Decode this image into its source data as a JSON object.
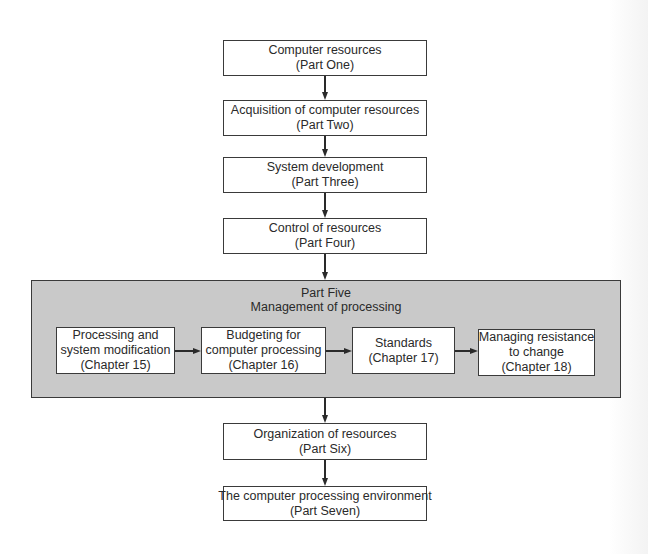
{
  "diagram": {
    "type": "flowchart",
    "nodes": [
      {
        "id": "p1",
        "line1": "Computer resources",
        "line2": "(Part One)"
      },
      {
        "id": "p2",
        "line1": "Acquisition of computer resources",
        "line2": "(Part Two)"
      },
      {
        "id": "p3",
        "line1": "System development",
        "line2": "(Part Three)"
      },
      {
        "id": "p4",
        "line1": "Control of resources",
        "line2": "(Part Four)"
      },
      {
        "id": "p6",
        "line1": "Organization of resources",
        "line2": "(Part Six)"
      },
      {
        "id": "p7",
        "line1": "The computer processing environment",
        "line2": "(Part Seven)"
      }
    ],
    "part_five": {
      "title_line1": "Part Five",
      "title_line2": "Management of processing",
      "fill_color": "#c9c9c9",
      "chapters": [
        {
          "id": "c15",
          "lines": [
            "Processing and",
            "system modification",
            "(Chapter 15)"
          ]
        },
        {
          "id": "c16",
          "lines": [
            "Budgeting for",
            "computer processing",
            "(Chapter 16)"
          ]
        },
        {
          "id": "c17",
          "lines": [
            "Standards",
            "(Chapter 17)"
          ]
        },
        {
          "id": "c18",
          "lines": [
            "Managing resistance",
            "to change",
            "(Chapter 18)"
          ]
        }
      ]
    },
    "edges": [
      [
        "p1",
        "p2"
      ],
      [
        "p2",
        "p3"
      ],
      [
        "p3",
        "p4"
      ],
      [
        "p4",
        "part_five"
      ],
      [
        "c15",
        "c16"
      ],
      [
        "c16",
        "c17"
      ],
      [
        "c17",
        "c18"
      ],
      [
        "part_five",
        "p6"
      ],
      [
        "p6",
        "p7"
      ]
    ]
  }
}
